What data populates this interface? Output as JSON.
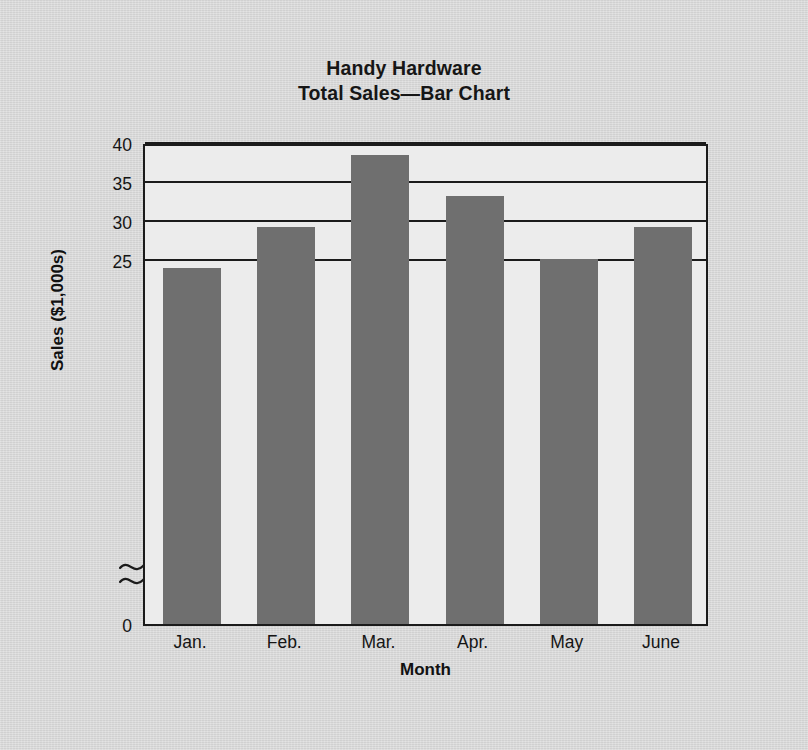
{
  "chart_data": {
    "type": "bar",
    "title": "Handy Hardware\nTotal Sales—Bar Chart",
    "title_lines": [
      "Handy Hardware",
      "Total Sales—Bar Chart"
    ],
    "categories": [
      "Jan.",
      "Feb.",
      "Mar.",
      "Apr.",
      "May",
      "June"
    ],
    "values": [
      24.0,
      29.2,
      38.5,
      33.2,
      25.1,
      29.2
    ],
    "xlabel": "Month",
    "ylabel": "Sales ($1,000s)",
    "ylim": [
      0,
      40
    ],
    "y_ticks": [
      0,
      25,
      30,
      35,
      40
    ],
    "y_tick_labels": [
      "0",
      "25",
      "30",
      "35",
      "40"
    ],
    "axis_break": {
      "present": true,
      "between": [
        0,
        25
      ],
      "symbol": "double-wave"
    },
    "grid": true,
    "grid_axis": "y",
    "legend": "none",
    "bar_color": "#6f6f6f",
    "plot_background": "#ececec",
    "page_background": "#d6d6d6",
    "axis_color": "#1b1b1b"
  },
  "chart": {
    "title_line1": "Handy Hardware",
    "title_line2": "Total Sales—Bar Chart",
    "y_axis_title": "Sales ($1,000s)",
    "x_axis_title": "Month",
    "y_labels": [
      "40",
      "35",
      "30",
      "25",
      "0"
    ],
    "x_labels": [
      "Jan.",
      "Feb.",
      "Mar.",
      "Apr.",
      "May",
      "June"
    ]
  }
}
